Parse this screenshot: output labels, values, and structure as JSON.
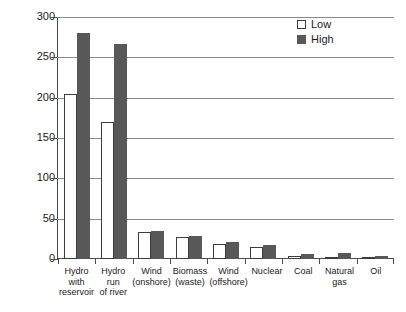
{
  "chart_data": {
    "type": "bar",
    "title": "",
    "xlabel": "",
    "ylabel": "",
    "ylim": [
      0,
      300
    ],
    "yticks": [
      0,
      50,
      100,
      150,
      200,
      250,
      300
    ],
    "grid": true,
    "legend_position": "top-right",
    "categories": [
      "Hydro with reservoir",
      "Hydro run of river",
      "Wind (onshore)",
      "Biomass (waste)",
      "Wind (offshore)",
      "Nuclear",
      "Coal",
      "Natural gas",
      "Oil"
    ],
    "category_lines": [
      [
        "Hydro with",
        "reservoir"
      ],
      [
        "Hydro run",
        "of river"
      ],
      [
        "Wind",
        "(onshore)"
      ],
      [
        "Biomass",
        "(waste)"
      ],
      [
        "Wind",
        "(offshore)"
      ],
      [
        "Nuclear",
        ""
      ],
      [
        "Coal",
        ""
      ],
      [
        "Natural",
        "gas"
      ],
      [
        "Oil",
        ""
      ]
    ],
    "series": [
      {
        "name": "Low",
        "color": "#ffffff",
        "values": [
          205,
          170,
          34,
          27,
          19,
          15,
          4,
          3,
          2
        ]
      },
      {
        "name": "High",
        "color": "#585858",
        "values": [
          280,
          267,
          35,
          28,
          21,
          17,
          6,
          7,
          4
        ]
      }
    ]
  },
  "legend": {
    "items": [
      {
        "label": "Low"
      },
      {
        "label": "High"
      }
    ]
  },
  "axis": {
    "y_tick_labels": [
      "300",
      "250",
      "200",
      "150",
      "100",
      "50",
      "0"
    ]
  },
  "colors": {
    "high_bar": "#585858",
    "low_bar": "#ffffff",
    "bar_outline": "#3c3c3c",
    "grid": "#8a8a8a",
    "axis": "#4a4a4a",
    "text": "#1a1a1a",
    "background": "#ffffff"
  }
}
